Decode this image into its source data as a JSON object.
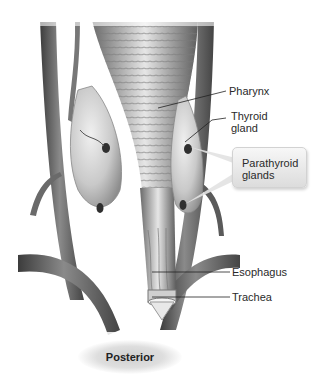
{
  "figure": {
    "view": "Posterior",
    "labels": {
      "pharynx": "Pharynx",
      "thyroid_gland": "Thyroid\ngland",
      "parathyroid_glands": "Parathyroid\nglands",
      "esophagus": "Esophagus",
      "trachea": "Trachea"
    },
    "colors": {
      "tissue_dark": "#4a4a4a",
      "tissue_mid": "#8c8c8c",
      "tissue_light": "#d6d6d6",
      "background": "#ffffff",
      "leader_line": "#222222"
    }
  }
}
